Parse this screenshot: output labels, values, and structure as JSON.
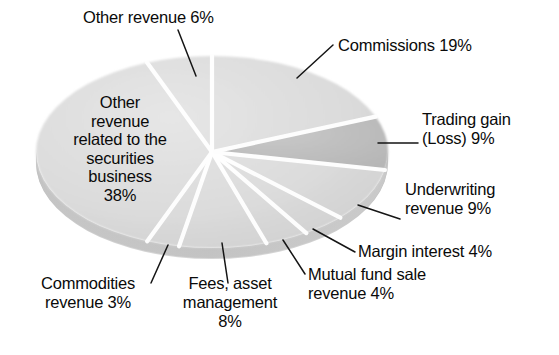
{
  "chart_data": {
    "type": "pie",
    "title": "",
    "subtitle": "",
    "xlabel": "",
    "ylabel": "",
    "legend_position": "none",
    "grid": false,
    "units": "percent",
    "total": 100,
    "start_angle_deg": 0,
    "direction": "clockwise",
    "categories": [
      "Commissions",
      "Trading gain (Loss)",
      "Underwriting revenue",
      "Margin interest",
      "Mutual fund sale revenue",
      "Fees, asset management",
      "Commodities revenue",
      "Other revenue related to the securities business",
      "Other revenue"
    ],
    "values": [
      19,
      9,
      9,
      4,
      4,
      8,
      3,
      38,
      6
    ],
    "slices": [
      {
        "name": "Commissions",
        "label": "Commissions 19%",
        "value": 19,
        "value_text": "19%",
        "color": "#dddddd",
        "label_position": "outside-top-right"
      },
      {
        "name": "Trading gain (Loss)",
        "label": "Trading gain\n(Loss) 9%",
        "value": 9,
        "value_text": "9%",
        "color": "#bfbfbf",
        "label_position": "outside-right"
      },
      {
        "name": "Underwriting revenue",
        "label": "Underwriting\nrevenue 9%",
        "value": 9,
        "value_text": "9%",
        "color": "#dddddd",
        "label_position": "outside-right"
      },
      {
        "name": "Margin interest",
        "label": "Margin interest 4%",
        "value": 4,
        "value_text": "4%",
        "color": "#dddddd",
        "label_position": "outside-bottom-right"
      },
      {
        "name": "Mutual fund sale revenue",
        "label": "Mutual fund sale\nrevenue 4%",
        "value": 4,
        "value_text": "4%",
        "color": "#dddddd",
        "label_position": "outside-bottom-right"
      },
      {
        "name": "Fees, asset management",
        "label": "Fees, asset\nmanagement\n8%",
        "value": 8,
        "value_text": "8%",
        "color": "#dddddd",
        "label_position": "outside-bottom"
      },
      {
        "name": "Commodities revenue",
        "label": "Commodities\nrevenue 3%",
        "value": 3,
        "value_text": "3%",
        "color": "#dddddd",
        "label_position": "outside-bottom-left"
      },
      {
        "name": "Other revenue related to the securities business",
        "label": "Other\nrevenue\nrelated to the\nsecurities\nbusiness\n38%",
        "value": 38,
        "value_text": "38%",
        "color": "#dddddd",
        "label_position": "inside"
      },
      {
        "name": "Other revenue",
        "label": "Other revenue 6%",
        "value": 6,
        "value_text": "6%",
        "color": "#dddddd",
        "label_position": "outside-top-left"
      }
    ],
    "colors": {
      "background": "#ffffff",
      "slice_light": "#dddddd",
      "slice_dark": "#bfbfbf",
      "divider": "#ffffff",
      "depth_shadow": "#b3b3b3",
      "text": "#0a0a0a",
      "leader_line": "#111111"
    }
  }
}
